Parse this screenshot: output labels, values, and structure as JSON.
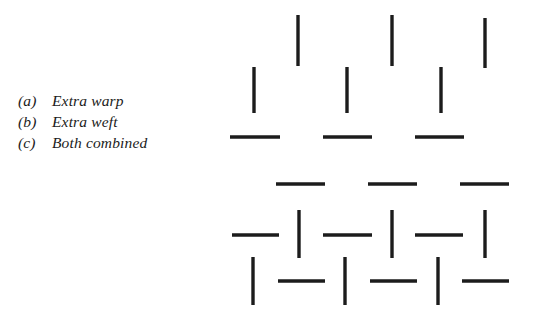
{
  "figure": {
    "background_color": "#ffffff",
    "ink_color": "#1c1c1c"
  },
  "legend": {
    "rows": [
      {
        "key": "(a)",
        "label": "Extra warp"
      },
      {
        "key": "(b)",
        "label": "Extra weft"
      },
      {
        "key": "(c)",
        "label": "Both combined"
      }
    ]
  },
  "diagram_data": {
    "type": "mark-diagram",
    "units": "px",
    "stroke_width": 3.4,
    "groups": [
      {
        "name": "extra-warp",
        "legend_key": "(a)",
        "marks": [
          {
            "orientation": "vertical",
            "x": 298,
            "y1": 15,
            "y2": 66
          },
          {
            "orientation": "vertical",
            "x": 392,
            "y1": 15,
            "y2": 66
          },
          {
            "orientation": "vertical",
            "x": 485,
            "y1": 18,
            "y2": 68
          },
          {
            "orientation": "vertical",
            "x": 254,
            "y1": 67,
            "y2": 113
          },
          {
            "orientation": "vertical",
            "x": 347,
            "y1": 67,
            "y2": 113
          },
          {
            "orientation": "vertical",
            "x": 441,
            "y1": 67,
            "y2": 113
          }
        ]
      },
      {
        "name": "extra-weft",
        "legend_key": "(b)",
        "marks": [
          {
            "orientation": "horizontal",
            "y": 137,
            "x1": 230,
            "x2": 280
          },
          {
            "orientation": "horizontal",
            "y": 137,
            "x1": 323,
            "x2": 372
          },
          {
            "orientation": "horizontal",
            "y": 137,
            "x1": 415,
            "x2": 464
          },
          {
            "orientation": "horizontal",
            "y": 184,
            "x1": 276,
            "x2": 325
          },
          {
            "orientation": "horizontal",
            "y": 184,
            "x1": 368,
            "x2": 417
          },
          {
            "orientation": "horizontal",
            "y": 184,
            "x1": 460,
            "x2": 509
          }
        ]
      },
      {
        "name": "both-combined",
        "legend_key": "(c)",
        "marks": [
          {
            "orientation": "horizontal",
            "y": 235,
            "x1": 232,
            "x2": 279
          },
          {
            "orientation": "vertical",
            "x": 299,
            "y1": 210,
            "y2": 258
          },
          {
            "orientation": "horizontal",
            "y": 235,
            "x1": 323,
            "x2": 372
          },
          {
            "orientation": "vertical",
            "x": 392,
            "y1": 210,
            "y2": 258
          },
          {
            "orientation": "horizontal",
            "y": 235,
            "x1": 415,
            "x2": 463
          },
          {
            "orientation": "vertical",
            "x": 485,
            "y1": 210,
            "y2": 258
          },
          {
            "orientation": "vertical",
            "x": 253,
            "y1": 257,
            "y2": 305
          },
          {
            "orientation": "horizontal",
            "y": 281,
            "x1": 278,
            "x2": 325
          },
          {
            "orientation": "vertical",
            "x": 345,
            "y1": 257,
            "y2": 305
          },
          {
            "orientation": "horizontal",
            "y": 281,
            "x1": 370,
            "x2": 417
          },
          {
            "orientation": "vertical",
            "x": 438,
            "y1": 257,
            "y2": 305
          },
          {
            "orientation": "horizontal",
            "y": 281,
            "x1": 462,
            "x2": 509
          }
        ]
      }
    ]
  }
}
